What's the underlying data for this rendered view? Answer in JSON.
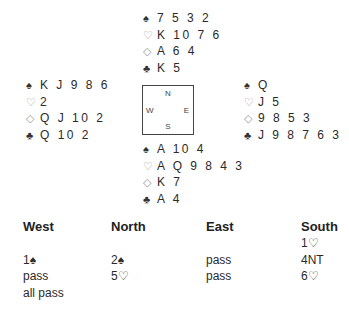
{
  "hands": {
    "north": [
      {
        "suit": "spade-icon",
        "symbol": "♠",
        "cards": "7 5 3 2",
        "outline": false
      },
      {
        "suit": "heart-icon",
        "symbol": "♡",
        "cards": "K 10 7 6",
        "outline": true
      },
      {
        "suit": "diamond-icon",
        "symbol": "◇",
        "cards": "A 6 4",
        "outline": true
      },
      {
        "suit": "club-icon",
        "symbol": "♣",
        "cards": "K 5",
        "outline": false
      }
    ],
    "west": [
      {
        "suit": "spade-icon",
        "symbol": "♠",
        "cards": "K J 9 8 6",
        "outline": false
      },
      {
        "suit": "heart-icon",
        "symbol": "♡",
        "cards": "2",
        "outline": true
      },
      {
        "suit": "diamond-icon",
        "symbol": "◇",
        "cards": "Q J 10 2",
        "outline": true
      },
      {
        "suit": "club-icon",
        "symbol": "♣",
        "cards": "Q 10 2",
        "outline": false
      }
    ],
    "east": [
      {
        "suit": "spade-icon",
        "symbol": "♠",
        "cards": "Q",
        "outline": false
      },
      {
        "suit": "heart-icon",
        "symbol": "♡",
        "cards": "J 5",
        "outline": true
      },
      {
        "suit": "diamond-icon",
        "symbol": "◇",
        "cards": "9 8 5 3",
        "outline": true
      },
      {
        "suit": "club-icon",
        "symbol": "♣",
        "cards": "J 9 8 7 6 3",
        "outline": false
      }
    ],
    "south": [
      {
        "suit": "spade-icon",
        "symbol": "♠",
        "cards": "A 10 4",
        "outline": false
      },
      {
        "suit": "heart-icon",
        "symbol": "♡",
        "cards": "A Q 9 8 4 3",
        "outline": true
      },
      {
        "suit": "diamond-icon",
        "symbol": "◇",
        "cards": "K 7",
        "outline": true
      },
      {
        "suit": "club-icon",
        "symbol": "♣",
        "cards": "A 4",
        "outline": false
      }
    ]
  },
  "compass": {
    "n": "N",
    "s": "S",
    "w": "W",
    "e": "E"
  },
  "auction": {
    "headers": [
      "West",
      "North",
      "East",
      "South"
    ],
    "rows": [
      [
        "",
        "",
        "",
        "1♡"
      ],
      [
        "1♠",
        "2♠",
        "pass",
        "4NT"
      ],
      [
        "pass",
        "5♡",
        "pass",
        "6♡"
      ],
      [
        "all pass",
        "",
        "",
        ""
      ]
    ]
  }
}
